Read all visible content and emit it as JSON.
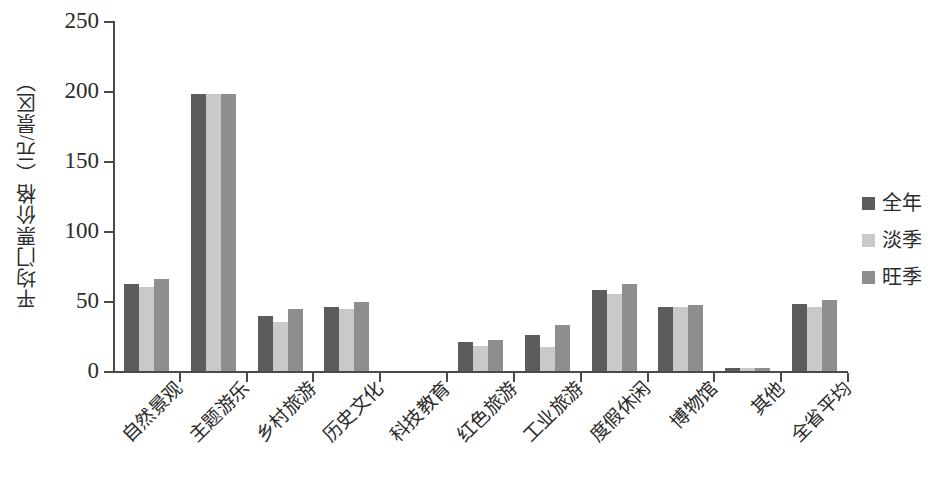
{
  "chart_data": {
    "type": "bar",
    "title": "",
    "xlabel": "",
    "ylabel": "平均门票价格（元/景区）",
    "ylim": [
      0,
      250
    ],
    "yticks": [
      0,
      50,
      100,
      150,
      200,
      250
    ],
    "ytick_labels": [
      "0",
      "50",
      "100",
      "150",
      "200",
      "250"
    ],
    "grid": false,
    "legend_position": "right",
    "categories": [
      "自然景观",
      "主题游乐",
      "乡村旅游",
      "历史文化",
      "科技教育",
      "红色旅游",
      "工业旅游",
      "度假休闲",
      "博物馆",
      "其他",
      "全省平均"
    ],
    "series": [
      {
        "name": "全年",
        "color": "#5c5c5c",
        "values": [
          62,
          198,
          39,
          46,
          0,
          21,
          26,
          58,
          46,
          2,
          48
        ]
      },
      {
        "name": "淡季",
        "color": "#c9c9c9",
        "values": [
          60,
          198,
          35,
          44,
          0,
          18,
          17,
          55,
          46,
          2,
          46
        ]
      },
      {
        "name": "旺季",
        "color": "#8e8e8e",
        "values": [
          66,
          198,
          44,
          49,
          0,
          22,
          33,
          62,
          47,
          2,
          51
        ]
      }
    ]
  }
}
